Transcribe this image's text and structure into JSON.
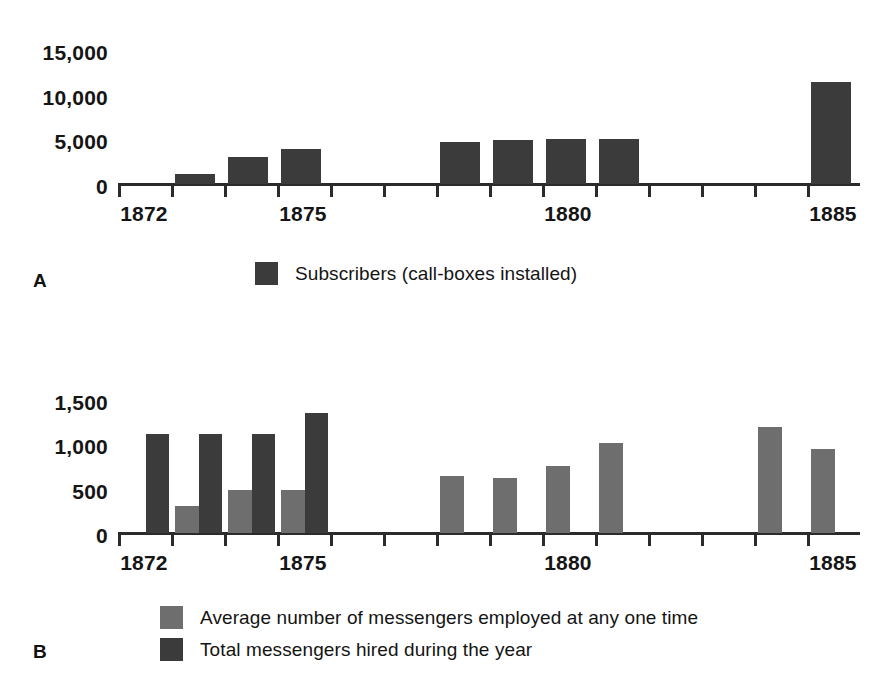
{
  "figure": {
    "panels": [
      {
        "letter": "A",
        "legend": [
          {
            "label": "Subscribers (call-boxes installed)",
            "color": "#3b3b3b",
            "swatch_name": "legend-swatch-subscribers"
          }
        ]
      },
      {
        "letter": "B",
        "legend": [
          {
            "label": "Average number of messengers employed at any one time",
            "color": "#6e6e6e",
            "swatch_name": "legend-swatch-average-messengers"
          },
          {
            "label": "Total messengers hired during the year",
            "color": "#3b3b3b",
            "swatch_name": "legend-swatch-total-messengers"
          }
        ]
      }
    ]
  },
  "chart_data": [
    {
      "id": "panel-a",
      "type": "bar",
      "title": "",
      "xlabel": "",
      "ylabel": "",
      "ylim": [
        0,
        15000
      ],
      "yticks": [
        0,
        5000,
        10000,
        15000
      ],
      "ytick_labels": [
        "0",
        "5,000",
        "10,000",
        "15,000"
      ],
      "grid": false,
      "legend_position": "below-center",
      "categories": [
        1872,
        1873,
        1874,
        1875,
        1876,
        1877,
        1878,
        1879,
        1880,
        1881,
        1882,
        1883,
        1884,
        1885
      ],
      "xtick_labels": [
        "1872",
        "",
        "",
        "1875",
        "",
        "",
        "",
        "",
        "1880",
        "",
        "",
        "",
        "",
        "1885"
      ],
      "series": [
        {
          "name": "Subscribers (call-boxes installed)",
          "color": "#3b3b3b",
          "values": [
            0,
            1100,
            3000,
            3900,
            0,
            0,
            4700,
            4900,
            5000,
            5000,
            0,
            0,
            0,
            11400
          ]
        }
      ]
    },
    {
      "id": "panel-b",
      "type": "bar",
      "title": "",
      "xlabel": "",
      "ylabel": "",
      "ylim": [
        0,
        1500
      ],
      "yticks": [
        0,
        500,
        1000,
        1500
      ],
      "ytick_labels": [
        "0",
        "500",
        "1,000",
        "1,500"
      ],
      "grid": false,
      "legend_position": "below-left",
      "categories": [
        1872,
        1873,
        1874,
        1875,
        1876,
        1877,
        1878,
        1879,
        1880,
        1881,
        1882,
        1883,
        1884,
        1885
      ],
      "xtick_labels": [
        "1872",
        "",
        "",
        "1875",
        "",
        "",
        "",
        "",
        "1880",
        "",
        "",
        "",
        "",
        "1885"
      ],
      "series": [
        {
          "name": "Average number of messengers employed at any one time",
          "color": "#6e6e6e",
          "values": [
            0,
            300,
            490,
            490,
            0,
            0,
            640,
            620,
            760,
            1010,
            0,
            0,
            1200,
            950
          ]
        },
        {
          "name": "Total messengers hired during the year",
          "color": "#3b3b3b",
          "values": [
            1120,
            1120,
            1120,
            1350,
            0,
            0,
            0,
            0,
            0,
            0,
            0,
            0,
            0,
            0
          ]
        }
      ]
    }
  ]
}
